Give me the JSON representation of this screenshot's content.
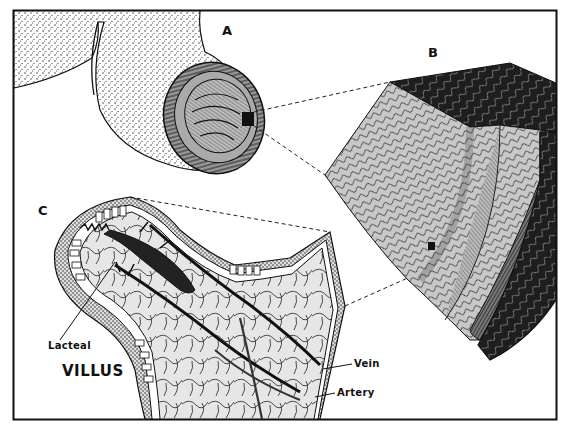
{
  "figure": {
    "colors": {
      "ink": "#111111",
      "paper": "#ffffff",
      "stipple": "#6a6a6a",
      "tissue_light": "#cfcfcf",
      "tissue_mid": "#9a9a9a",
      "tissue_dark": "#2a2a2a",
      "cell_fill": "#e8e8e8"
    },
    "panels": [
      {
        "id": "A",
        "label": "A",
        "depicts": "small-intestine-tube-cross-section"
      },
      {
        "id": "B",
        "label": "B",
        "depicts": "intestinal-wall-block-with-villi"
      },
      {
        "id": "C",
        "label": "C",
        "depicts": "single-villus-detail"
      }
    ],
    "callouts": {
      "lacteal": "Lacteal",
      "vein": "Vein",
      "artery": "Artery"
    },
    "title": "VILLUS",
    "signature": "ef"
  }
}
